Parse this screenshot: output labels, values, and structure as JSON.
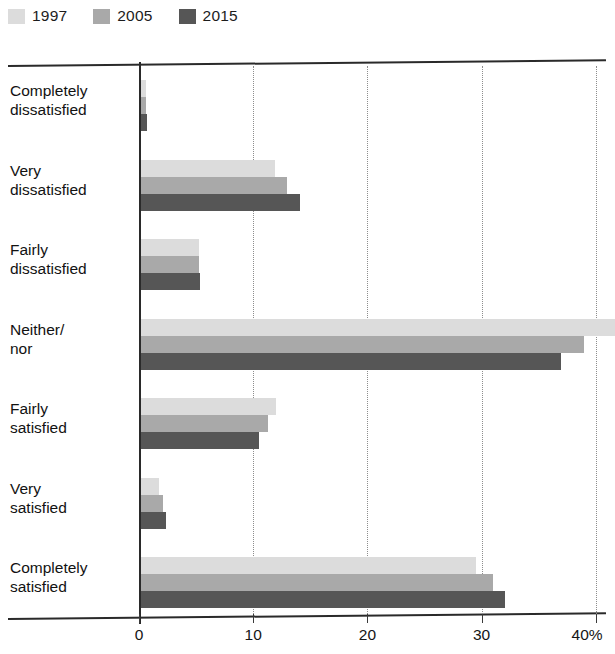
{
  "legend": {
    "items": [
      {
        "label": "1997",
        "color": "#dcdcdc",
        "swatch_name": "legend-swatch-1997"
      },
      {
        "label": "2005",
        "color": "#a9a9a9",
        "swatch_name": "legend-swatch-2005"
      },
      {
        "label": "2015",
        "color": "#565656",
        "swatch_name": "legend-swatch-2015"
      }
    ]
  },
  "axis": {
    "x_ticks": [
      "0",
      "10",
      "20",
      "30",
      "40%"
    ],
    "x_tick_values": [
      0,
      10,
      20,
      30,
      40
    ]
  },
  "chart_data": {
    "type": "bar",
    "orientation": "horizontal",
    "title": "",
    "subtitle": "",
    "xlabel": "",
    "ylabel": "",
    "xlim": [
      0,
      40
    ],
    "xunit": "%",
    "grid": true,
    "legend_position": "top-left",
    "categories": [
      "Completely\ndissatisfied",
      "Very\ndissatisfied",
      "Fairly\ndissatisfied",
      "Neither/\nnor",
      "Fairly\nsatisfied",
      "Very\nsatisfied",
      "Completely\nsatisfied"
    ],
    "series": [
      {
        "name": "1997",
        "color": "#dcdcdc",
        "values": [
          0.4,
          11.7,
          5.1,
          41.5,
          11.8,
          1.6,
          29.3
        ]
      },
      {
        "name": "2005",
        "color": "#a9a9a9",
        "values": [
          0.4,
          12.8,
          5.1,
          38.8,
          11.1,
          1.9,
          30.8
        ]
      },
      {
        "name": "2015",
        "color": "#565656",
        "values": [
          0.5,
          13.9,
          5.2,
          36.8,
          10.3,
          2.2,
          31.9
        ]
      }
    ]
  }
}
